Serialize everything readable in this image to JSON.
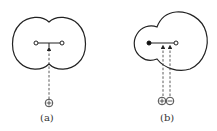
{
  "figure": {
    "panels": [
      {
        "id": "a",
        "label": "(a)",
        "shape": "symmetric two-lobed (dumbbell) electron cloud",
        "nuclei": [
          "open-circle",
          "open-circle"
        ],
        "approaching_charges": [
          "positive"
        ],
        "arrow_count": 1
      },
      {
        "id": "b",
        "label": "(b)",
        "shape": "asymmetric electron cloud, small left lobe, large right lobe",
        "nuclei": [
          "filled-dot",
          "open-circle"
        ],
        "approaching_charges": [
          "positive",
          "negative"
        ],
        "arrow_count": 2
      }
    ],
    "colors": {
      "line": "#222222",
      "background": "#ffffff"
    }
  }
}
